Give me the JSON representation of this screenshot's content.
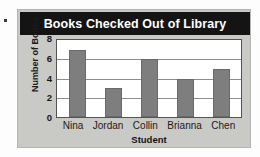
{
  "chart_data": {
    "type": "bar",
    "title": "Books Checked Out of Library",
    "xlabel": "Student",
    "ylabel": "Number of Books",
    "categories": [
      "Nina",
      "Jordan",
      "Collin",
      "Brianna",
      "Chen"
    ],
    "values": [
      7,
      3,
      6,
      4,
      5
    ],
    "ylim": [
      0,
      8
    ],
    "yticks": [
      0,
      2,
      4,
      6,
      8
    ],
    "gridlines": [
      2,
      4,
      6
    ],
    "grid": true,
    "legend": null,
    "colors": {
      "bar_fill": "#7e7e7e",
      "bar_border": "#6a6a6a",
      "title_background": "#141414",
      "title_text": "#ffffff",
      "card_background": "#c9c9c6",
      "plot_background": "#ffffff",
      "axis_text": "#1b1b1b"
    }
  }
}
